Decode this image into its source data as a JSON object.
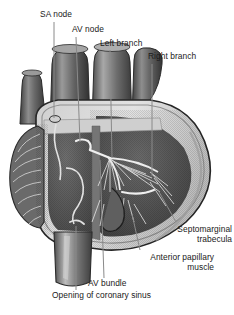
{
  "figure": {
    "background_color": "#ffffff",
    "text_color": "#1a1a1a",
    "leader_color": "#8a8a8a"
  },
  "palette": {
    "outline_dark": "#2b2b2b",
    "epicardium_light": "#d9d9d9",
    "myocardium_mid": "#6e6e6e",
    "chamber_dark": "#4a4a4a",
    "vessel_dark": "#555555",
    "vessel_light": "#b9b9b9",
    "atrium_band": "#cfcfcf",
    "fiber_light": "#e8e8e8",
    "node_outline": "#3a3a3a"
  },
  "labels": [
    {
      "id": "sa-node",
      "text": "SA node",
      "align": "left",
      "x": 40,
      "y": 12
    },
    {
      "id": "av-node",
      "text": "AV node",
      "align": "left",
      "x": 72,
      "y": 27
    },
    {
      "id": "left-branch",
      "text": "Left branch",
      "align": "left",
      "x": 100,
      "y": 41
    },
    {
      "id": "right-branch",
      "text": "Right branch",
      "align": "left",
      "x": 148,
      "y": 54
    },
    {
      "id": "septomarginal",
      "text": "Septomarginal\ntrabecula",
      "align": "right",
      "x": 152,
      "y": 227
    },
    {
      "id": "anterior-papillary",
      "text": "Anterior papillary\nmuscle",
      "align": "right",
      "x": 118,
      "y": 255
    },
    {
      "id": "av-bundle",
      "text": "AV bundle",
      "align": "left",
      "x": 88,
      "y": 281
    },
    {
      "id": "coronary-sinus",
      "text": "Opening of coronary sinus",
      "align": "left",
      "x": 52,
      "y": 292
    }
  ],
  "structures": [
    {
      "id": "superior-vena-cava",
      "name": "Superior vena cava"
    },
    {
      "id": "aorta",
      "name": "Aorta"
    },
    {
      "id": "pulmonary-trunk",
      "name": "Pulmonary trunk"
    },
    {
      "id": "pulmonary-vein",
      "name": "Pulmonary vein"
    },
    {
      "id": "right-auricle",
      "name": "Right auricle with pectinate muscles"
    },
    {
      "id": "right-atrium",
      "name": "Right atrium"
    },
    {
      "id": "right-ventricle",
      "name": "Right ventricle"
    },
    {
      "id": "interventricular-septum",
      "name": "Interventricular septum"
    },
    {
      "id": "purkinje-fibers",
      "name": "Purkinje fiber network"
    },
    {
      "id": "inferior-vena-cava",
      "name": "Inferior vena cava"
    },
    {
      "id": "myocardium-wall",
      "name": "Myocardial wall"
    }
  ]
}
